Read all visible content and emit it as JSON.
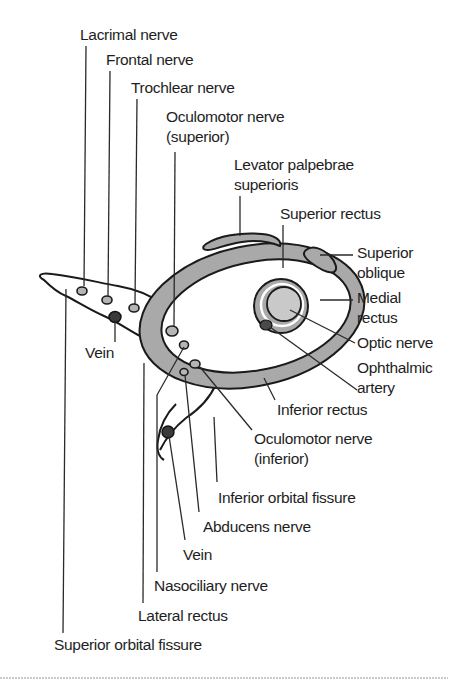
{
  "figure": {
    "colors": {
      "muscle_fill": "#a9a9a9",
      "outline": "#1a1a1a",
      "vein_fill": "#3a3a3a",
      "text": "#1e1e1e",
      "background": "#ffffff"
    },
    "labels": {
      "lacrimal_nerve": "Lacrimal nerve",
      "frontal_nerve": "Frontal nerve",
      "trochlear_nerve": "Trochlear nerve",
      "oculomotor_superior_1": "Oculomotor nerve",
      "oculomotor_superior_2": "(superior)",
      "levator_1": "Levator palpebrae",
      "levator_2": "superioris",
      "superior_rectus": "Superior rectus",
      "superior_oblique_1": "Superior",
      "superior_oblique_2": "oblique",
      "medial_rectus_1": "Medial",
      "medial_rectus_2": "rectus",
      "optic_nerve": "Optic nerve",
      "ophthalmic_artery_1": "Ophthalmic",
      "ophthalmic_artery_2": "artery",
      "vein_upper": "Vein",
      "inferior_rectus": "Inferior rectus",
      "oculomotor_inferior_1": "Oculomotor nerve",
      "oculomotor_inferior_2": "(inferior)",
      "inferior_orbital_fissure": "Inferior orbital fissure",
      "abducens_nerve": "Abducens nerve",
      "vein_lower": "Vein",
      "nasociliary_nerve": "Nasociliary nerve",
      "lateral_rectus": "Lateral rectus",
      "superior_orbital_fissure": "Superior orbital fissure"
    }
  }
}
